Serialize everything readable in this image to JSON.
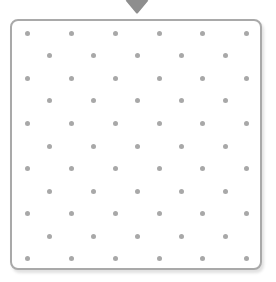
{
  "pointer": {
    "icon": "triangle-down-icon",
    "color": "#8e8e8e"
  },
  "board": {
    "border_color": "#a9a9a9",
    "dot_color": "#a8a8a8",
    "rows": [
      {
        "y": 33,
        "xs": [
          27,
          71,
          115,
          159,
          202,
          246
        ]
      },
      {
        "y": 55,
        "xs": [
          49,
          93,
          137,
          181,
          225
        ]
      },
      {
        "y": 78,
        "xs": [
          27,
          71,
          115,
          159,
          202,
          246
        ]
      },
      {
        "y": 100,
        "xs": [
          49,
          93,
          137,
          181,
          225
        ]
      },
      {
        "y": 123,
        "xs": [
          27,
          71,
          115,
          159,
          202,
          246
        ]
      },
      {
        "y": 146,
        "xs": [
          49,
          93,
          137,
          181,
          225
        ]
      },
      {
        "y": 168,
        "xs": [
          27,
          71,
          115,
          159,
          202,
          246
        ]
      },
      {
        "y": 191,
        "xs": [
          49,
          93,
          137,
          181,
          225
        ]
      },
      {
        "y": 213,
        "xs": [
          27,
          71,
          115,
          159,
          202,
          246
        ]
      },
      {
        "y": 236,
        "xs": [
          49,
          93,
          137,
          181,
          225
        ]
      },
      {
        "y": 258,
        "xs": [
          27,
          71,
          115,
          159,
          202,
          246
        ]
      }
    ]
  }
}
